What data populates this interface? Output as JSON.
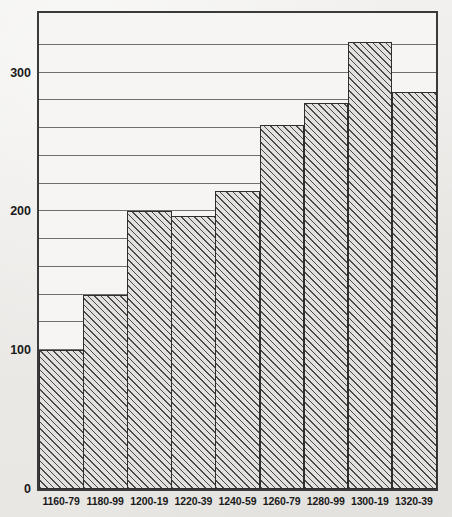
{
  "chart_data": {
    "type": "bar",
    "title": "",
    "subtitle": "",
    "xlabel": "",
    "ylabel": "",
    "categories": [
      "1160-79",
      "1180-99",
      "1200-19",
      "1220-39",
      "1240-59",
      "1260-79",
      "1280-99",
      "1300-19",
      "1320-39"
    ],
    "values": [
      100,
      140,
      200,
      197,
      215,
      262,
      278,
      322,
      286
    ],
    "ylim": [
      0,
      343
    ],
    "ytick_labels": [
      "0",
      "100",
      "200",
      "300"
    ],
    "ytick_values": [
      0,
      100,
      200,
      300
    ],
    "gridline_values": [
      20,
      40,
      60,
      80,
      100,
      120,
      140,
      160,
      180,
      200,
      220,
      240,
      260,
      280,
      300,
      320
    ],
    "grid": true,
    "legend": "none",
    "bar_fill": "diagonal-hatch",
    "colors": {
      "frame": "#3a3a3a",
      "gridline": "#6e6e6e",
      "bar_outline": "#2e2e2e",
      "bar_hatch": "#4a4a4a",
      "plot_background": "#f6f5f3",
      "page_background": "#eceae7",
      "text": "#1a1a1a"
    }
  }
}
